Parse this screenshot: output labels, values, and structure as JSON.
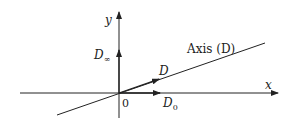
{
  "diagram": {
    "axis_x_label": "x",
    "axis_y_label": "y",
    "origin_label": "0",
    "line_label": "Axis (D)",
    "vectors": [
      {
        "name": "D",
        "label": "D"
      },
      {
        "name": "D0",
        "label": "D",
        "subscript": "0"
      },
      {
        "name": "Dinf",
        "label": "D",
        "subscript": "∞"
      }
    ],
    "colors": {
      "stroke": "#222222",
      "background": "#ffffff"
    }
  }
}
